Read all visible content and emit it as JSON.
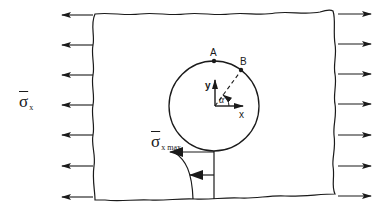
{
  "figure": {
    "labels": {
      "applied_stress_symbol": "σ",
      "applied_stress_subscript": "x",
      "max_stress_symbol": "σ",
      "max_stress_subscript": "x max",
      "point_a": "A",
      "point_b": "B",
      "axis_x": "x",
      "axis_y": "y",
      "angle": "α"
    },
    "colors": {
      "stroke": "#1a1a1a",
      "background": "#ffffff"
    },
    "plate": {
      "top_left": [
        95,
        14
      ],
      "top_right": [
        333,
        11
      ],
      "bottom_right": [
        335,
        194
      ],
      "bottom_left": [
        95,
        200
      ]
    },
    "hole": {
      "cx": 214,
      "cy": 106,
      "r": 45
    },
    "load_arrows": {
      "left_count": 7,
      "right_count": 7,
      "left_y": [
        15,
        45,
        75,
        105,
        135,
        166,
        197
      ],
      "right_y": [
        14,
        44,
        74,
        104,
        135,
        166,
        196
      ]
    }
  }
}
